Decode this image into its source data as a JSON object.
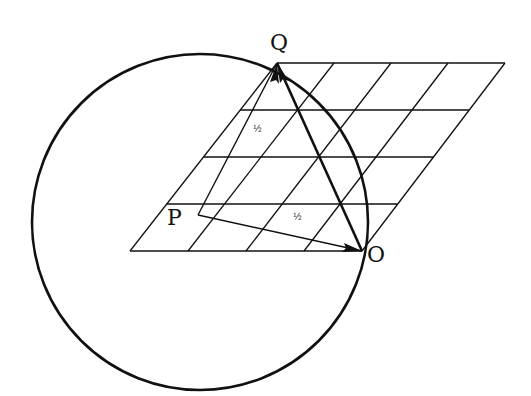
{
  "labels": {
    "Q": "Q",
    "P": "P",
    "O": "O",
    "half1": "½",
    "half2": "½"
  },
  "colors": {
    "ink": "#111111",
    "background": "#ffffff"
  },
  "grid": {
    "rows": 4,
    "cols": 4,
    "bottom_left": [
      130,
      251
    ],
    "bottom_right": [
      362,
      251
    ],
    "top_left": [
      277,
      63
    ],
    "top_right": [
      505,
      63
    ]
  },
  "circle": {
    "cx": 200,
    "cy": 222,
    "r": 168
  }
}
